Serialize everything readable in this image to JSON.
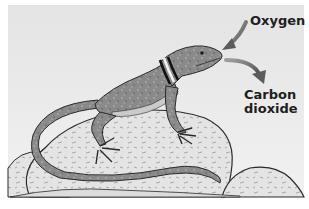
{
  "figure": {
    "labels": {
      "oxygen": "Oxygen",
      "carbon_dioxide_line1": "Carbon",
      "carbon_dioxide_line2": "dioxide"
    },
    "arrows": [
      {
        "name": "oxygen-arrow",
        "direction": "inward",
        "target": "lizard-mouth"
      },
      {
        "name": "carbon-dioxide-arrow",
        "direction": "outward",
        "source": "lizard-mouth"
      }
    ],
    "colors": {
      "background_light": "#eeeeee",
      "background_dark": "#d9d9d9",
      "lizard_body": "#8c8c8c",
      "lizard_belly": "#c8c8c8",
      "rock": "#e2e2e2",
      "arrow": "#6e6e6e",
      "outline": "#2a2a2a",
      "text": "#1e1e1e"
    }
  }
}
